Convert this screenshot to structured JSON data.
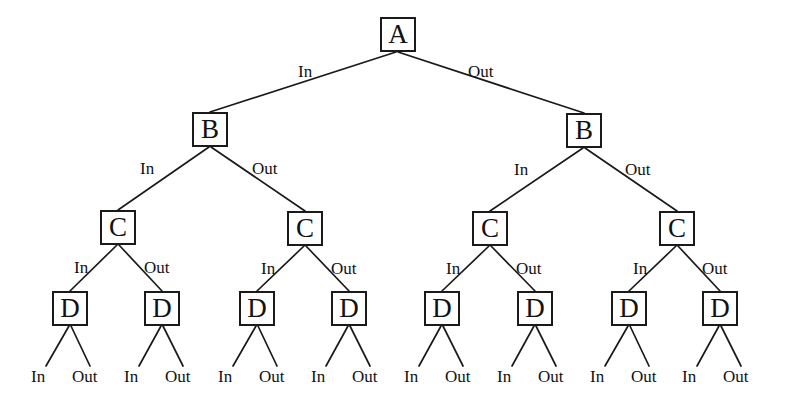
{
  "diagram": {
    "type": "decision-tree",
    "stroke_color": "#1a1a1a",
    "text_color": "#111111",
    "background_color": "#ffffff",
    "labels": {
      "in": "In",
      "out": "Out"
    },
    "levels": [
      {
        "name": "level-a",
        "node_label": "A",
        "count": 1
      },
      {
        "name": "level-b",
        "node_label": "B",
        "count": 2
      },
      {
        "name": "level-c",
        "node_label": "C",
        "count": 4
      },
      {
        "name": "level-d",
        "node_label": "D",
        "count": 8
      }
    ],
    "nodes": [
      {
        "id": "a1",
        "label": "A",
        "x": 380,
        "y": 17,
        "level": "A"
      },
      {
        "id": "b1",
        "label": "B",
        "x": 192,
        "y": 112,
        "level": "B"
      },
      {
        "id": "b2",
        "label": "B",
        "x": 566,
        "y": 113,
        "level": "B"
      },
      {
        "id": "c1",
        "label": "C",
        "x": 100,
        "y": 210,
        "level": "C"
      },
      {
        "id": "c2",
        "label": "C",
        "x": 287,
        "y": 211,
        "level": "C"
      },
      {
        "id": "c3",
        "label": "C",
        "x": 472,
        "y": 211,
        "level": "C"
      },
      {
        "id": "c4",
        "label": "C",
        "x": 659,
        "y": 211,
        "level": "C"
      },
      {
        "id": "d1",
        "label": "D",
        "x": 52,
        "y": 291,
        "level": "D"
      },
      {
        "id": "d2",
        "label": "D",
        "x": 144,
        "y": 291,
        "level": "D"
      },
      {
        "id": "d3",
        "label": "D",
        "x": 239,
        "y": 291,
        "level": "D"
      },
      {
        "id": "d4",
        "label": "D",
        "x": 331,
        "y": 291,
        "level": "D"
      },
      {
        "id": "d5",
        "label": "D",
        "x": 424,
        "y": 291,
        "level": "D"
      },
      {
        "id": "d6",
        "label": "D",
        "x": 517,
        "y": 291,
        "level": "D"
      },
      {
        "id": "d7",
        "label": "D",
        "x": 611,
        "y": 291,
        "level": "D"
      },
      {
        "id": "d8",
        "label": "D",
        "x": 702,
        "y": 291,
        "level": "D"
      }
    ],
    "edges": [
      {
        "from": "a1",
        "to": "b1",
        "label": "In",
        "x1": 396,
        "y1": 52,
        "x2": 210,
        "y2": 112
      },
      {
        "from": "a1",
        "to": "b2",
        "label": "Out",
        "x1": 398,
        "y1": 52,
        "x2": 584,
        "y2": 113
      },
      {
        "from": "b1",
        "to": "c1",
        "label": "In",
        "x1": 209,
        "y1": 147,
        "x2": 118,
        "y2": 210
      },
      {
        "from": "b1",
        "to": "c2",
        "label": "Out",
        "x1": 211,
        "y1": 147,
        "x2": 305,
        "y2": 211
      },
      {
        "from": "b2",
        "to": "c3",
        "label": "In",
        "x1": 583,
        "y1": 148,
        "x2": 490,
        "y2": 211
      },
      {
        "from": "b2",
        "to": "c4",
        "label": "Out",
        "x1": 585,
        "y1": 148,
        "x2": 677,
        "y2": 211
      },
      {
        "from": "c1",
        "to": "d1",
        "label": "In",
        "x1": 117,
        "y1": 245,
        "x2": 70,
        "y2": 291
      },
      {
        "from": "c1",
        "to": "d2",
        "label": "Out",
        "x1": 119,
        "y1": 245,
        "x2": 162,
        "y2": 291
      },
      {
        "from": "c2",
        "to": "d3",
        "label": "In",
        "x1": 304,
        "y1": 246,
        "x2": 257,
        "y2": 291
      },
      {
        "from": "c2",
        "to": "d4",
        "label": "Out",
        "x1": 306,
        "y1": 246,
        "x2": 349,
        "y2": 291
      },
      {
        "from": "c3",
        "to": "d5",
        "label": "In",
        "x1": 489,
        "y1": 246,
        "x2": 442,
        "y2": 291
      },
      {
        "from": "c3",
        "to": "d6",
        "label": "Out",
        "x1": 491,
        "y1": 246,
        "x2": 535,
        "y2": 291
      },
      {
        "from": "c4",
        "to": "d7",
        "label": "In",
        "x1": 676,
        "y1": 246,
        "x2": 629,
        "y2": 291
      },
      {
        "from": "c4",
        "to": "d8",
        "label": "Out",
        "x1": 678,
        "y1": 246,
        "x2": 720,
        "y2": 291
      },
      {
        "from": "d1",
        "to": "leaf1",
        "label": "In",
        "x1": 69,
        "y1": 326,
        "x2": 46,
        "y2": 366
      },
      {
        "from": "d1",
        "to": "leaf2",
        "label": "Out",
        "x1": 71,
        "y1": 326,
        "x2": 90,
        "y2": 366
      },
      {
        "from": "d2",
        "to": "leaf3",
        "label": "In",
        "x1": 161,
        "y1": 326,
        "x2": 139,
        "y2": 366
      },
      {
        "from": "d2",
        "to": "leaf4",
        "label": "Out",
        "x1": 163,
        "y1": 326,
        "x2": 183,
        "y2": 366
      },
      {
        "from": "d3",
        "to": "leaf5",
        "label": "In",
        "x1": 256,
        "y1": 326,
        "x2": 233,
        "y2": 366
      },
      {
        "from": "d3",
        "to": "leaf6",
        "label": "Out",
        "x1": 258,
        "y1": 326,
        "x2": 277,
        "y2": 366
      },
      {
        "from": "d4",
        "to": "leaf7",
        "label": "In",
        "x1": 348,
        "y1": 326,
        "x2": 326,
        "y2": 366
      },
      {
        "from": "d4",
        "to": "leaf8",
        "label": "Out",
        "x1": 350,
        "y1": 326,
        "x2": 370,
        "y2": 366
      },
      {
        "from": "d5",
        "to": "leaf9",
        "label": "In",
        "x1": 441,
        "y1": 326,
        "x2": 419,
        "y2": 366
      },
      {
        "from": "d5",
        "to": "leaf10",
        "label": "Out",
        "x1": 443,
        "y1": 326,
        "x2": 463,
        "y2": 366
      },
      {
        "from": "d6",
        "to": "leaf11",
        "label": "In",
        "x1": 534,
        "y1": 326,
        "x2": 512,
        "y2": 366
      },
      {
        "from": "d6",
        "to": "leaf12",
        "label": "Out",
        "x1": 536,
        "y1": 326,
        "x2": 556,
        "y2": 366
      },
      {
        "from": "d7",
        "to": "leaf13",
        "label": "In",
        "x1": 628,
        "y1": 326,
        "x2": 605,
        "y2": 366
      },
      {
        "from": "d7",
        "to": "leaf14",
        "label": "Out",
        "x1": 630,
        "y1": 326,
        "x2": 649,
        "y2": 366
      },
      {
        "from": "d8",
        "to": "leaf15",
        "label": "In",
        "x1": 719,
        "y1": 326,
        "x2": 697,
        "y2": 366
      },
      {
        "from": "d8",
        "to": "leaf16",
        "label": "Out",
        "x1": 721,
        "y1": 326,
        "x2": 741,
        "y2": 366
      }
    ],
    "edge_labels": [
      {
        "id": "el-a-in",
        "text": "In",
        "x": 298,
        "y": 63
      },
      {
        "id": "el-a-out",
        "text": "Out",
        "x": 468,
        "y": 63
      },
      {
        "id": "el-b1-in",
        "text": "In",
        "x": 140,
        "y": 160
      },
      {
        "id": "el-b1-out",
        "text": "Out",
        "x": 252,
        "y": 160
      },
      {
        "id": "el-b2-in",
        "text": "In",
        "x": 514,
        "y": 161
      },
      {
        "id": "el-b2-out",
        "text": "Out",
        "x": 625,
        "y": 161
      },
      {
        "id": "el-c1-in",
        "text": "In",
        "x": 74,
        "y": 259
      },
      {
        "id": "el-c1-out",
        "text": "Out",
        "x": 144,
        "y": 259
      },
      {
        "id": "el-c2-in",
        "text": "In",
        "x": 261,
        "y": 260
      },
      {
        "id": "el-c2-out",
        "text": "Out",
        "x": 331,
        "y": 260
      },
      {
        "id": "el-c3-in",
        "text": "In",
        "x": 446,
        "y": 260
      },
      {
        "id": "el-c3-out",
        "text": "Out",
        "x": 516,
        "y": 260
      },
      {
        "id": "el-c4-in",
        "text": "In",
        "x": 633,
        "y": 260
      },
      {
        "id": "el-c4-out",
        "text": "Out",
        "x": 702,
        "y": 260
      }
    ],
    "leaf_labels": [
      {
        "id": "leaf1",
        "text": "In",
        "x": 31,
        "y": 368
      },
      {
        "id": "leaf2",
        "text": "Out",
        "x": 72,
        "y": 368
      },
      {
        "id": "leaf3",
        "text": "In",
        "x": 124,
        "y": 368
      },
      {
        "id": "leaf4",
        "text": "Out",
        "x": 165,
        "y": 368
      },
      {
        "id": "leaf5",
        "text": "In",
        "x": 218,
        "y": 368
      },
      {
        "id": "leaf6",
        "text": "Out",
        "x": 259,
        "y": 368
      },
      {
        "id": "leaf7",
        "text": "In",
        "x": 311,
        "y": 368
      },
      {
        "id": "leaf8",
        "text": "Out",
        "x": 352,
        "y": 368
      },
      {
        "id": "leaf9",
        "text": "In",
        "x": 404,
        "y": 368
      },
      {
        "id": "leaf10",
        "text": "Out",
        "x": 445,
        "y": 368
      },
      {
        "id": "leaf11",
        "text": "In",
        "x": 497,
        "y": 368
      },
      {
        "id": "leaf12",
        "text": "Out",
        "x": 538,
        "y": 368
      },
      {
        "id": "leaf13",
        "text": "In",
        "x": 590,
        "y": 368
      },
      {
        "id": "leaf14",
        "text": "Out",
        "x": 631,
        "y": 368
      },
      {
        "id": "leaf15",
        "text": "In",
        "x": 682,
        "y": 368
      },
      {
        "id": "leaf16",
        "text": "Out",
        "x": 723,
        "y": 368
      }
    ]
  }
}
